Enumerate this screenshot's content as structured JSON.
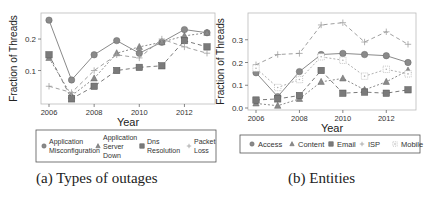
{
  "chart_data": [
    {
      "type": "line",
      "title": "",
      "caption": "(a) Types of outages",
      "xlabel": "Year",
      "ylabel": "Fraction of Threads",
      "x": [
        2006,
        2007,
        2008,
        2009,
        2010,
        2011,
        2012,
        2013
      ],
      "xticks": [
        "2006",
        "2008",
        "2010",
        "2012"
      ],
      "yticks": [
        "0.1",
        "0.2"
      ],
      "ylim": [
        0.0,
        0.27
      ],
      "grid": false,
      "legend_position": "bottom",
      "series": [
        {
          "name": "Application Misconfiguration",
          "marker": "circle",
          "style": "solid",
          "values": [
            0.26,
            0.07,
            0.15,
            0.195,
            0.155,
            0.19,
            0.23,
            0.22
          ]
        },
        {
          "name": "Application Server Down",
          "marker": "triangle",
          "style": "dotted",
          "values": [
            0.14,
            0.02,
            0.075,
            0.155,
            0.175,
            0.19,
            0.21,
            0.22
          ]
        },
        {
          "name": "Dns Resolution",
          "marker": "square",
          "style": "dashed",
          "values": [
            0.15,
            0.01,
            0.05,
            0.1,
            0.11,
            0.115,
            0.195,
            0.175
          ]
        },
        {
          "name": "Packet Loss",
          "marker": "plus",
          "style": "dashed",
          "values": [
            0.05,
            0.03,
            0.1,
            0.15,
            0.14,
            0.2,
            0.175,
            0.155
          ]
        }
      ]
    },
    {
      "type": "line",
      "title": "",
      "caption": "(b) Entities",
      "xlabel": "Year",
      "ylabel": "Fraction of Threads",
      "x": [
        2006,
        2007,
        2008,
        2009,
        2010,
        2011,
        2012,
        2013
      ],
      "xticks": [
        "2006",
        "2008",
        "2010",
        "2012"
      ],
      "yticks": [
        "0.0",
        "0.1",
        "0.2",
        "0.3"
      ],
      "ylim": [
        0.0,
        0.4
      ],
      "grid": false,
      "legend_position": "bottom",
      "series": [
        {
          "name": "Access",
          "marker": "circle",
          "style": "solid",
          "values": [
            0.155,
            0.05,
            0.16,
            0.235,
            0.24,
            0.235,
            0.23,
            0.2
          ]
        },
        {
          "name": "Content",
          "marker": "triangle",
          "style": "dotted",
          "values": [
            0.02,
            0.01,
            0.04,
            0.115,
            0.13,
            0.08,
            0.115,
            0.165
          ]
        },
        {
          "name": "Email",
          "marker": "square",
          "style": "dashed",
          "values": [
            0.035,
            0.04,
            0.055,
            0.165,
            0.065,
            0.07,
            0.065,
            0.08
          ]
        },
        {
          "name": "ISP",
          "marker": "plus",
          "style": "dashed",
          "values": [
            0.19,
            0.235,
            0.24,
            0.365,
            0.375,
            0.29,
            0.335,
            0.28
          ]
        },
        {
          "name": "Mobile",
          "marker": "dotted-square",
          "style": "dotted",
          "values": [
            0.175,
            0.09,
            0.125,
            0.225,
            0.21,
            0.14,
            0.17,
            0.15
          ]
        }
      ]
    }
  ],
  "legend_a": {
    "items": [
      {
        "line1": "Application",
        "line2": "Misconfiguration",
        "line3": ""
      },
      {
        "line1": "Application",
        "line2": "Server",
        "line3": "Down"
      },
      {
        "line1": "Dns",
        "line2": "Resolution",
        "line3": ""
      },
      {
        "line1": "Packet",
        "line2": "Loss",
        "line3": ""
      }
    ]
  },
  "legend_b": {
    "items": [
      "Access",
      "Content",
      "Email",
      "ISP",
      "Mobile"
    ]
  },
  "captions": {
    "a": "(a) Types of outages",
    "b": "(b) Entities"
  }
}
